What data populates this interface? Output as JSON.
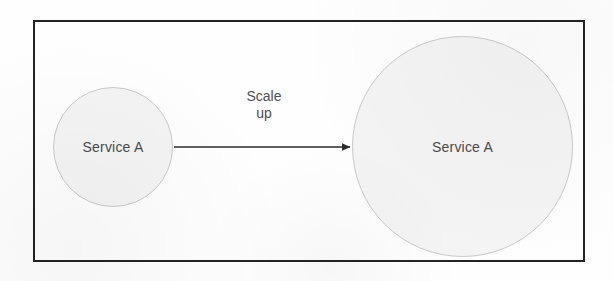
{
  "diagram": {
    "title": "Scale up",
    "frame": {
      "name": "diagram-border",
      "border_color": "#232323",
      "background_color": "#fefefe"
    },
    "nodes": [
      {
        "id": "service-a-small",
        "label": "Service A",
        "shape": "circle",
        "size": "small",
        "fill_color": "#f4f4f4",
        "stroke_color": "#c9c9c9"
      },
      {
        "id": "service-a-large",
        "label": "Service A",
        "shape": "circle",
        "size": "large",
        "fill_color": "#f4f4f4",
        "stroke_color": "#c9c9c9"
      }
    ],
    "edges": [
      {
        "id": "scale-up-arrow",
        "from": "service-a-small",
        "to": "service-a-large",
        "label_line_1": "Scale",
        "label_line_2": "up",
        "stroke_color": "#2b2b2b",
        "arrowhead": "filled-triangle"
      }
    ],
    "text_color": "#4a4a4a"
  }
}
